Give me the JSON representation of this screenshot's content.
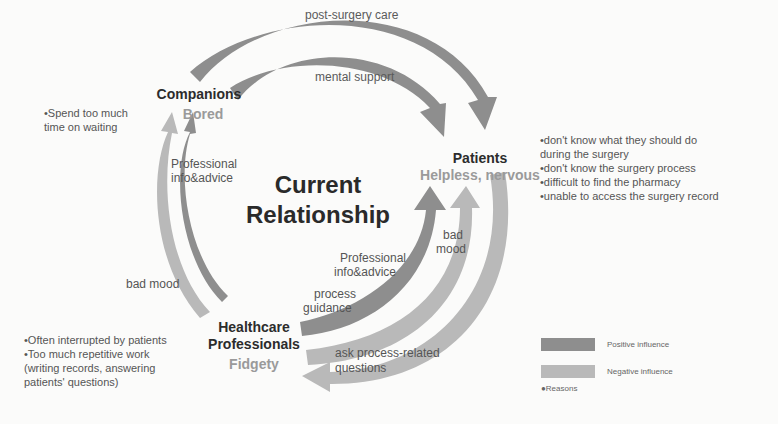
{
  "title": {
    "line1": "Current",
    "line2": "Relationship"
  },
  "actors": {
    "companions": {
      "name": "Companions",
      "mood": "Bored"
    },
    "patients": {
      "name": "Patients",
      "mood": "Helpless, nervous"
    },
    "healthcare": {
      "name_line1": "Healthcare",
      "name_line2": "Professionals",
      "mood": "Fidgety"
    }
  },
  "reasons": {
    "companions": [
      "•Spend too much",
      "time on waiting"
    ],
    "patients": [
      "•don't know what they should do",
      "during the surgery",
      "•don't know the surgery process",
      "•difficult to find the pharmacy",
      "•unable to access the surgery record"
    ],
    "healthcare": [
      "•Often interrupted by patients",
      "•Too much repetitive work",
      "(writing records, answering",
      "patients' questions)"
    ]
  },
  "arrow_labels": {
    "post_surgery_care": "post-surgery care",
    "mental_support": "mental support",
    "prof_info_comp_1": "Professional",
    "prof_info_comp_2": "info&advice",
    "bad_mood_hc_comp": "bad mood",
    "prof_info_pat_1": "Professional",
    "prof_info_pat_2": "info&advice",
    "process_guidance_1": "process",
    "process_guidance_2": "guidance",
    "bad_mood_pat_1": "bad",
    "bad_mood_pat_2": "mood",
    "ask_questions_1": "ask process-related",
    "ask_questions_2": "questions"
  },
  "legend": {
    "positive": {
      "label": "Positive influence",
      "color": "#8e8e8e"
    },
    "negative": {
      "label": "Negative influence",
      "color": "#b9b9b9"
    },
    "reasons": "●Reasons"
  }
}
